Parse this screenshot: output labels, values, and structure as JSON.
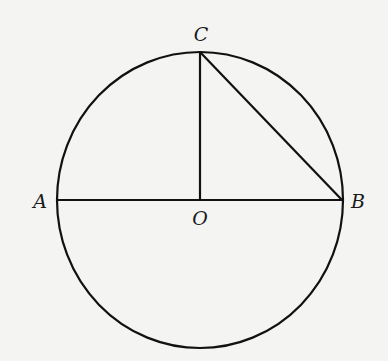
{
  "diagram": {
    "type": "circle-geometry",
    "background": "#f4f4f2",
    "stroke": "#111111",
    "circle": {
      "center": "O",
      "cx": 200,
      "cy": 200,
      "r": 143
    },
    "points": {
      "A": {
        "label": "A",
        "x": 57,
        "y": 200
      },
      "B": {
        "label": "B",
        "x": 342,
        "y": 200
      },
      "C": {
        "label": "C",
        "x": 200,
        "y": 52
      },
      "O": {
        "label": "O",
        "x": 200,
        "y": 200
      }
    },
    "segments": [
      {
        "name": "AB",
        "from": "A",
        "to": "B"
      },
      {
        "name": "OC",
        "from": "O",
        "to": "C"
      },
      {
        "name": "CB",
        "from": "C",
        "to": "B"
      }
    ],
    "labels": {
      "A": "A",
      "B": "B",
      "C": "C",
      "O": "O"
    }
  }
}
